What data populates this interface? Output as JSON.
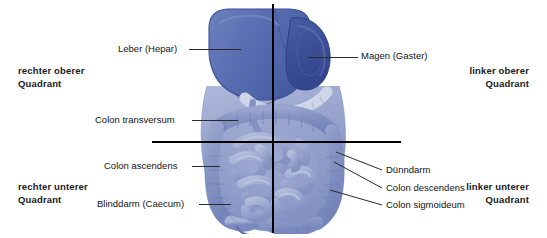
{
  "quadrants": [
    {
      "id": "right-upper",
      "label": "rechter oberer\nQuadrant",
      "position": "top-left"
    },
    {
      "id": "left-upper",
      "label": "linker oberer\nQuadrant",
      "position": "top-right"
    },
    {
      "id": "right-lower",
      "label": "rechter unterer\nQuadrant",
      "position": "bottom-left"
    },
    {
      "id": "left-lower",
      "label": "linker unterer\nQuadrant",
      "position": "bottom-right"
    }
  ],
  "callouts": [
    {
      "id": "leber",
      "label": "Leber (Hepar)"
    },
    {
      "id": "magen",
      "label": "Magen (Gaster)"
    },
    {
      "id": "colon-transversum",
      "label": "Colon transversum"
    },
    {
      "id": "colon-ascendens",
      "label": "Colon ascendens"
    },
    {
      "id": "blinddarm",
      "label": "Blinddarm (Caecum)"
    },
    {
      "id": "duenndarm",
      "label": "Dünndarm"
    },
    {
      "id": "colon-descendens",
      "label": "Colon descendens"
    },
    {
      "id": "colon-sigmoideum",
      "label": "Colon sigmoideum"
    }
  ],
  "colors": {
    "liver": "#5d72b5",
    "liver_shade": "#4c60a4",
    "liver_highlight": "#7184c2",
    "stomach": "#41549c",
    "intestine": "#8d9bc8",
    "intestine_light": "#aab4d8",
    "intestine_outline": "#6c7cb4",
    "pancreas": "#dfe3f0",
    "crosshair": "#000000",
    "leader": "#2b2b2b",
    "text": "#141414",
    "background": "#ffffff"
  }
}
